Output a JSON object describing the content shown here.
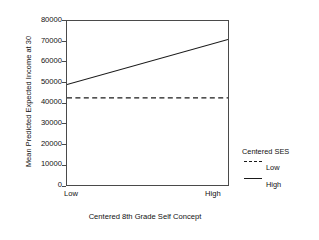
{
  "chart_data": {
    "type": "line",
    "title": "",
    "xlabel": "Centered 8th Grade Self Concept",
    "ylabel": "Mean Predicted Expected Income at 30",
    "x": [
      "Low",
      "High"
    ],
    "xtick_labels": [
      "Low",
      "High"
    ],
    "ytick_labels": [
      "0",
      "10000",
      "20000",
      "30000",
      "40000",
      "50000",
      "60000",
      "70000",
      "80000"
    ],
    "ytick_values": [
      0,
      10000,
      20000,
      30000,
      40000,
      50000,
      60000,
      70000,
      80000
    ],
    "ylim": [
      0,
      80000
    ],
    "grid": false,
    "legend_position": "right",
    "legend_title": "Centered SES",
    "series": [
      {
        "name": "Low",
        "style": "dashed",
        "color": "#1a1a1a",
        "values": [
          42500,
          42500
        ]
      },
      {
        "name": "High",
        "style": "solid",
        "color": "#1a1a1a",
        "values": [
          49000,
          71000
        ]
      }
    ]
  },
  "axes": {
    "ylabel": "Mean Predicted Expected Income at 30",
    "xlabel": "Centered 8th Grade Self Concept",
    "ytick_labels": [
      "80000",
      "70000",
      "60000",
      "50000",
      "40000",
      "30000",
      "20000",
      "10000",
      "0"
    ],
    "xtick_low": "Low",
    "xtick_high": "High"
  },
  "legend": {
    "title": "Centered SES",
    "entries": [
      {
        "label": "Low",
        "style": "dashed"
      },
      {
        "label": "High",
        "style": "solid"
      }
    ]
  }
}
